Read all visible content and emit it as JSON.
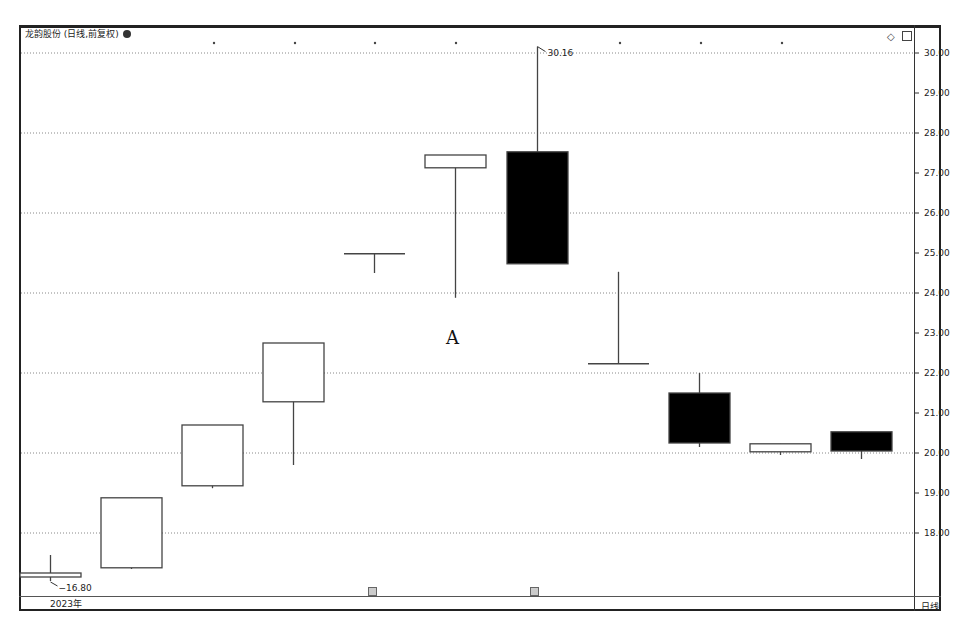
{
  "window": {
    "title": "龙韵股份 (日线,前复权)",
    "period_label": "日线",
    "year_label": "2023年",
    "top_icons": [
      "diamond-icon",
      "panel-icon"
    ]
  },
  "chart_data": {
    "type": "candlestick",
    "title": "龙韵股份 (日线,前复权)",
    "xlabel": "2023年",
    "ylabel": "",
    "ylim": [
      16.5,
      30.5
    ],
    "y_ticks": [
      "30.00",
      "29.00",
      "28.00",
      "27.00",
      "26.00",
      "25.00",
      "24.00",
      "23.00",
      "22.00",
      "21.00",
      "20.00",
      "19.00",
      "18.00"
    ],
    "grid": "dotted at even prices (18,20,22,24,26,28,30)",
    "annotations": [
      {
        "text": "30.16",
        "type": "high-marker",
        "candle": 7
      },
      {
        "text": "16.80",
        "type": "low-marker",
        "candle": 1
      },
      {
        "text": "A",
        "type": "label"
      }
    ],
    "candles": [
      {
        "index": 1,
        "open": 16.9,
        "close": 17.0,
        "high": 17.45,
        "low": 16.8,
        "color": "white"
      },
      {
        "index": 2,
        "open": 17.13,
        "close": 18.88,
        "high": 18.88,
        "low": 17.1,
        "color": "white"
      },
      {
        "index": 3,
        "open": 19.18,
        "close": 20.7,
        "high": 20.7,
        "low": 19.12,
        "color": "white"
      },
      {
        "index": 4,
        "open": 21.28,
        "close": 22.75,
        "high": 22.75,
        "low": 19.7,
        "color": "white"
      },
      {
        "index": 5,
        "open": 24.98,
        "close": 24.98,
        "high": 24.98,
        "low": 24.5,
        "color": "doji"
      },
      {
        "index": 6,
        "open": 27.13,
        "close": 27.45,
        "high": 27.45,
        "low": 23.88,
        "color": "white"
      },
      {
        "index": 7,
        "open": 27.53,
        "close": 24.73,
        "high": 30.16,
        "low": 24.73,
        "color": "black"
      },
      {
        "index": 8,
        "open": 22.23,
        "close": 22.23,
        "high": 24.53,
        "low": 22.23,
        "color": "doji"
      },
      {
        "index": 9,
        "open": 21.5,
        "close": 20.25,
        "high": 22.0,
        "low": 20.15,
        "color": "black"
      },
      {
        "index": 10,
        "open": 20.03,
        "close": 20.23,
        "high": 20.23,
        "low": 19.95,
        "color": "white"
      },
      {
        "index": 11,
        "open": 20.53,
        "close": 20.05,
        "high": 20.53,
        "low": 19.85,
        "color": "black"
      }
    ]
  }
}
